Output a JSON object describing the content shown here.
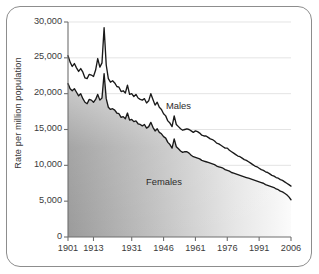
{
  "chart_data": {
    "type": "line",
    "title": "",
    "subtitle": "",
    "xlabel": "",
    "ylabel": "Rate per million population",
    "xlim": [
      1901,
      2006
    ],
    "ylim": [
      0,
      30000
    ],
    "grid": true,
    "legend_position": "inline-annotation",
    "y_ticks": [
      "0",
      "5,000",
      "10,000",
      "15,000",
      "20,000",
      "25,000",
      "30,000"
    ],
    "y_tick_values": [
      0,
      5000,
      10000,
      15000,
      20000,
      25000,
      30000
    ],
    "x_ticks": [
      "1901",
      "1913",
      "1931",
      "1946",
      "1961",
      "1976",
      "1991",
      "2006"
    ],
    "x_tick_values": [
      1901,
      1913,
      1931,
      1946,
      1961,
      1976,
      1991,
      2006
    ],
    "annotations": [
      {
        "text": "Males",
        "x": 1955,
        "y": 18000
      },
      {
        "text": "Females",
        "x": 1948,
        "y": 9200
      }
    ],
    "series": [
      {
        "name": "Males",
        "color": "#1a1a1a",
        "x": [
          1901,
          1902,
          1903,
          1904,
          1905,
          1906,
          1907,
          1908,
          1909,
          1910,
          1911,
          1912,
          1913,
          1914,
          1915,
          1916,
          1917,
          1918,
          1919,
          1920,
          1921,
          1922,
          1923,
          1924,
          1925,
          1926,
          1927,
          1928,
          1929,
          1930,
          1931,
          1932,
          1933,
          1934,
          1935,
          1936,
          1937,
          1938,
          1939,
          1940,
          1941,
          1942,
          1943,
          1944,
          1945,
          1946,
          1947,
          1948,
          1949,
          1950,
          1951,
          1952,
          1953,
          1954,
          1955,
          1956,
          1957,
          1958,
          1959,
          1960,
          1961,
          1962,
          1963,
          1964,
          1965,
          1966,
          1967,
          1968,
          1969,
          1970,
          1971,
          1972,
          1973,
          1974,
          1975,
          1976,
          1977,
          1978,
          1979,
          1980,
          1981,
          1982,
          1983,
          1984,
          1985,
          1986,
          1987,
          1988,
          1989,
          1990,
          1991,
          1992,
          1993,
          1994,
          1995,
          1996,
          1997,
          1998,
          1999,
          2000,
          2001,
          2002,
          2003,
          2004,
          2005,
          2006
        ],
        "y": [
          25300,
          24400,
          23800,
          24200,
          23600,
          23100,
          23500,
          23000,
          22200,
          22100,
          22700,
          22600,
          22400,
          23300,
          24900,
          23700,
          24300,
          29200,
          24000,
          22100,
          21600,
          21800,
          21500,
          21000,
          20900,
          20300,
          20400,
          20100,
          21200,
          19900,
          20000,
          19600,
          19900,
          19400,
          19200,
          19100,
          19300,
          18700,
          19000,
          20000,
          19200,
          18400,
          18800,
          18100,
          17800,
          17200,
          16900,
          16200,
          15900,
          15400,
          16900,
          15700,
          15400,
          15100,
          14900,
          15000,
          15100,
          15000,
          14800,
          14600,
          14800,
          14700,
          14500,
          14200,
          14100,
          14100,
          13900,
          13700,
          13600,
          13400,
          13100,
          13000,
          12800,
          12600,
          12400,
          12400,
          12100,
          11900,
          11700,
          11500,
          11300,
          11200,
          11000,
          10800,
          10700,
          10500,
          10300,
          10100,
          9900,
          9800,
          9600,
          9400,
          9300,
          9100,
          9000,
          8800,
          8600,
          8500,
          8300,
          8200,
          8000,
          7900,
          7700,
          7500,
          7300,
          7100
        ]
      },
      {
        "name": "Females",
        "color": "#1a1a1a",
        "x": [
          1901,
          1902,
          1903,
          1904,
          1905,
          1906,
          1907,
          1908,
          1909,
          1910,
          1911,
          1912,
          1913,
          1914,
          1915,
          1916,
          1917,
          1918,
          1919,
          1920,
          1921,
          1922,
          1923,
          1924,
          1925,
          1926,
          1927,
          1928,
          1929,
          1930,
          1931,
          1932,
          1933,
          1934,
          1935,
          1936,
          1937,
          1938,
          1939,
          1940,
          1941,
          1942,
          1943,
          1944,
          1945,
          1946,
          1947,
          1948,
          1949,
          1950,
          1951,
          1952,
          1953,
          1954,
          1955,
          1956,
          1957,
          1958,
          1959,
          1960,
          1961,
          1962,
          1963,
          1964,
          1965,
          1966,
          1967,
          1968,
          1969,
          1970,
          1971,
          1972,
          1973,
          1974,
          1975,
          1976,
          1977,
          1978,
          1979,
          1980,
          1981,
          1982,
          1983,
          1984,
          1985,
          1986,
          1987,
          1988,
          1989,
          1990,
          1991,
          1992,
          1993,
          1994,
          1995,
          1996,
          1997,
          1998,
          1999,
          2000,
          2001,
          2002,
          2003,
          2004,
          2005,
          2006
        ],
        "y": [
          21400,
          20700,
          20400,
          20700,
          20200,
          19700,
          20000,
          19300,
          18800,
          18600,
          19200,
          19100,
          18800,
          19200,
          19900,
          19100,
          19400,
          22800,
          19300,
          18100,
          17800,
          17900,
          17700,
          17300,
          17200,
          16700,
          16800,
          16500,
          17300,
          16300,
          16400,
          16100,
          16200,
          15800,
          15700,
          15500,
          15700,
          15200,
          15400,
          16000,
          15300,
          14800,
          15100,
          14600,
          14400,
          14000,
          13800,
          13200,
          12900,
          12400,
          13700,
          12600,
          12300,
          12000,
          11800,
          11900,
          11900,
          11700,
          11400,
          11200,
          11100,
          11000,
          10900,
          10700,
          10600,
          10500,
          10400,
          10300,
          10200,
          10100,
          9900,
          9800,
          9700,
          9600,
          9400,
          9300,
          9200,
          9000,
          8900,
          8800,
          8700,
          8600,
          8500,
          8400,
          8300,
          8200,
          8100,
          8000,
          7900,
          7800,
          7700,
          7600,
          7500,
          7300,
          7200,
          7100,
          7000,
          6900,
          6700,
          6600,
          6400,
          6300,
          6100,
          5900,
          5600,
          5200
        ]
      }
    ]
  },
  "axis": {
    "ylabel": "Rate per million population"
  }
}
